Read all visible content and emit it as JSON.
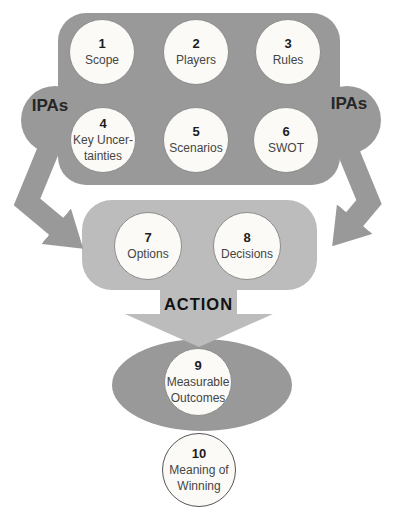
{
  "ipas": {
    "left_label": "IPAs",
    "right_label": "IPAs"
  },
  "action_label": "ACTION",
  "steps": [
    {
      "number": "1",
      "label": "Scope"
    },
    {
      "number": "2",
      "label": "Players"
    },
    {
      "number": "3",
      "label": "Rules"
    },
    {
      "number": "4",
      "label": "Key Uncer-\ntainties"
    },
    {
      "number": "5",
      "label": "Scenarios"
    },
    {
      "number": "6",
      "label": "SWOT"
    },
    {
      "number": "7",
      "label": "Options"
    },
    {
      "number": "8",
      "label": "Decisions"
    },
    {
      "number": "9",
      "label": "Measurable\nOutcomes"
    },
    {
      "number": "10",
      "label": "Meaning of\nWinning"
    }
  ],
  "colors": {
    "dark_gray": "#999999",
    "light_gray": "#bcbcbc",
    "circle_fill": "#fbfaf7",
    "circle_border": "#8d8d8d",
    "number_text": "#1d1d1d",
    "label_text": "#454545"
  }
}
